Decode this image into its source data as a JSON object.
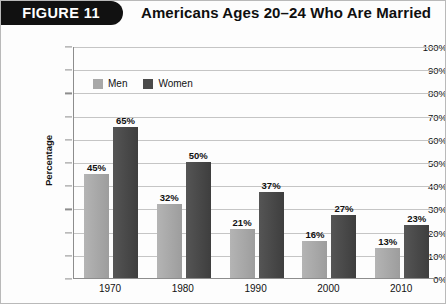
{
  "figure": {
    "tab_label": "FIGURE 11",
    "title": "Americans Ages 20–24 Who Are Married"
  },
  "chart_data": {
    "type": "bar",
    "title": "Americans Ages 20–24 Who Are Married",
    "xlabel": "",
    "ylabel": "Percentage",
    "ylim": [
      0,
      100
    ],
    "ytick_labels": [
      "0%",
      "10%",
      "20%",
      "30%",
      "40%",
      "50%",
      "60%",
      "70%",
      "80%",
      "90%",
      "100%"
    ],
    "yticks": [
      0,
      10,
      20,
      30,
      40,
      50,
      60,
      70,
      80,
      90,
      100
    ],
    "grid": true,
    "legend_position": "top-left-inside",
    "categories": [
      "1970",
      "1980",
      "1990",
      "2000",
      "2010"
    ],
    "series": [
      {
        "name": "Men",
        "color": "#a8a8a8",
        "values": [
          45,
          32,
          21,
          16,
          13
        ],
        "labels": [
          "45%",
          "32%",
          "21%",
          "16%",
          "13%"
        ]
      },
      {
        "name": "Women",
        "color": "#4a4a4a",
        "values": [
          65,
          50,
          37,
          27,
          23
        ],
        "labels": [
          "65%",
          "50%",
          "37%",
          "27%",
          "23%"
        ]
      }
    ]
  }
}
